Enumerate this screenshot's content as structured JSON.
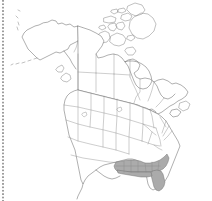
{
  "figure": {
    "kind": "range-map",
    "background_color": "#ffffff",
    "coastline_color": "#6e6e6e",
    "boundary_color": "#8a8a8a",
    "shading_color": "#ababab",
    "width": 212,
    "height": 201
  },
  "legend": {
    "shaded_meaning": "present",
    "unshaded_meaning": "absent"
  },
  "artifacts": {
    "left_margin": {
      "name": "dotted-scan-margin",
      "color": "#8c8c8c",
      "x": 2
    }
  },
  "map_data": {
    "type": "choropleth",
    "projection": "conic",
    "regions_shaded": [
      "Florida",
      "Georgia",
      "Alabama",
      "Mississippi",
      "Louisiana",
      "South Carolina",
      "North Carolina",
      "Tennessee",
      "Arkansas",
      "Texas (east)"
    ],
    "countries_shown": [
      "United States",
      "Canada",
      "Mexico (northern edge)"
    ],
    "features": [
      "Alaska",
      "Aleutian Islands",
      "Canadian Arctic Archipelago",
      "Hudson Bay",
      "Great Lakes",
      "Baffin Island",
      "Newfoundland",
      "Vancouver Island",
      "Florida Peninsula",
      "Gulf of Mexico",
      "Baja California"
    ]
  }
}
